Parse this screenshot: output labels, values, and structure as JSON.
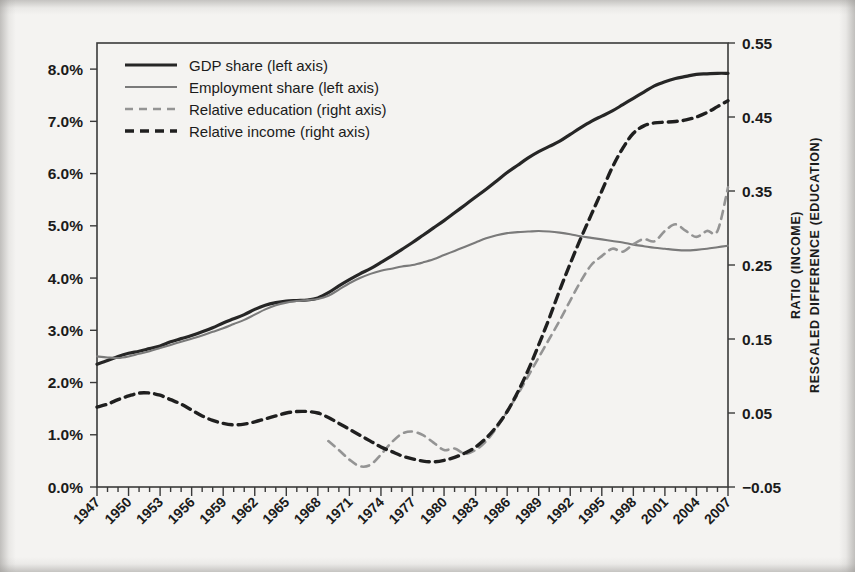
{
  "chart_data": {
    "type": "line",
    "title": "",
    "xlabel": "",
    "ylabel_left": "",
    "ylabel_right_line1": "RATIO (INCOME)",
    "ylabel_right_line2": "RESCALED DIFFERENCE (EDUCATION)",
    "grid": false,
    "legend_position": "top-left",
    "x": [
      1947,
      1948,
      1949,
      1950,
      1951,
      1952,
      1953,
      1954,
      1955,
      1956,
      1957,
      1958,
      1959,
      1960,
      1961,
      1962,
      1963,
      1964,
      1965,
      1966,
      1967,
      1968,
      1969,
      1970,
      1971,
      1972,
      1973,
      1974,
      1975,
      1976,
      1977,
      1978,
      1979,
      1980,
      1981,
      1982,
      1983,
      1984,
      1985,
      1986,
      1987,
      1988,
      1989,
      1990,
      1991,
      1992,
      1993,
      1994,
      1995,
      1996,
      1997,
      1998,
      1999,
      2000,
      2001,
      2002,
      2003,
      2004,
      2005,
      2006,
      2007
    ],
    "xtick_labels": [
      "1947",
      "1950",
      "1953",
      "1956",
      "1959",
      "1962",
      "1965",
      "1968",
      "1971",
      "1974",
      "1977",
      "1980",
      "1983",
      "1986",
      "1989",
      "1992",
      "1995",
      "1998",
      "2001",
      "2004",
      "2007"
    ],
    "xlim": [
      1947,
      2007
    ],
    "left_axis": {
      "ticks": [
        0.0,
        1.0,
        2.0,
        3.0,
        4.0,
        5.0,
        6.0,
        7.0,
        8.0
      ],
      "tick_labels": [
        "0.0%",
        "1.0%",
        "2.0%",
        "3.0%",
        "4.0%",
        "5.0%",
        "6.0%",
        "7.0%",
        "8.0%"
      ],
      "ylim": [
        0.0,
        8.5
      ],
      "unit": "%"
    },
    "right_axis": {
      "ticks": [
        -0.05,
        0.05,
        0.15,
        0.25,
        0.35,
        0.45,
        0.55
      ],
      "tick_labels": [
        "-0.05",
        "0.05",
        "0.15",
        "0.25",
        "0.35",
        "0.45",
        "0.55"
      ],
      "ylim": [
        -0.05,
        0.55
      ]
    },
    "series": [
      {
        "name": "GDP share (left axis)",
        "axis": "left",
        "style": "solid",
        "color": "#262626",
        "width": 3.2,
        "values": [
          2.35,
          2.42,
          2.5,
          2.56,
          2.6,
          2.65,
          2.7,
          2.78,
          2.84,
          2.9,
          2.97,
          3.05,
          3.14,
          3.22,
          3.3,
          3.4,
          3.48,
          3.53,
          3.56,
          3.57,
          3.58,
          3.62,
          3.72,
          3.85,
          3.97,
          4.08,
          4.18,
          4.3,
          4.42,
          4.55,
          4.68,
          4.82,
          4.96,
          5.1,
          5.25,
          5.4,
          5.55,
          5.7,
          5.86,
          6.02,
          6.16,
          6.3,
          6.42,
          6.52,
          6.62,
          6.75,
          6.88,
          7.0,
          7.1,
          7.2,
          7.32,
          7.44,
          7.56,
          7.68,
          7.76,
          7.82,
          7.86,
          7.9,
          7.91,
          7.92,
          7.92
        ]
      },
      {
        "name": "Employment share (left axis)",
        "axis": "left",
        "style": "solid",
        "color": "#7a7a7a",
        "width": 2.1,
        "values": [
          2.5,
          2.48,
          2.47,
          2.5,
          2.55,
          2.6,
          2.66,
          2.72,
          2.78,
          2.84,
          2.9,
          2.97,
          3.04,
          3.12,
          3.2,
          3.3,
          3.4,
          3.48,
          3.53,
          3.56,
          3.58,
          3.6,
          3.66,
          3.78,
          3.9,
          4.0,
          4.08,
          4.14,
          4.18,
          4.22,
          4.25,
          4.3,
          4.36,
          4.44,
          4.52,
          4.6,
          4.68,
          4.76,
          4.82,
          4.86,
          4.88,
          4.89,
          4.9,
          4.89,
          4.87,
          4.84,
          4.8,
          4.77,
          4.74,
          4.71,
          4.68,
          4.64,
          4.61,
          4.58,
          4.56,
          4.54,
          4.53,
          4.54,
          4.56,
          4.59,
          4.62
        ]
      },
      {
        "name": "Relative education (right axis)",
        "axis": "right",
        "style": "dashed",
        "color": "#949494",
        "width": 2.6,
        "start_year": 1969,
        "values": [
          null,
          null,
          null,
          null,
          null,
          null,
          null,
          null,
          null,
          null,
          null,
          null,
          null,
          null,
          null,
          null,
          null,
          null,
          null,
          null,
          null,
          null,
          0.012,
          0.0,
          -0.013,
          -0.022,
          -0.02,
          -0.006,
          0.01,
          0.022,
          0.025,
          0.02,
          0.01,
          0.0,
          0.002,
          -0.005,
          0.0,
          0.012,
          0.03,
          0.052,
          0.075,
          0.1,
          0.125,
          0.15,
          0.175,
          0.202,
          0.228,
          0.25,
          0.262,
          0.272,
          0.268,
          0.278,
          0.285,
          0.282,
          0.296,
          0.305,
          0.296,
          0.288,
          0.296,
          0.296,
          0.355
        ]
      },
      {
        "name": "Relative income (right axis)",
        "axis": "right",
        "style": "dashed",
        "color": "#1f1f1f",
        "width": 3.4,
        "values": [
          0.058,
          0.062,
          0.068,
          0.073,
          0.077,
          0.077,
          0.074,
          0.068,
          0.062,
          0.054,
          0.046,
          0.04,
          0.036,
          0.034,
          0.035,
          0.038,
          0.042,
          0.046,
          0.05,
          0.052,
          0.052,
          0.05,
          0.044,
          0.036,
          0.028,
          0.02,
          0.012,
          0.004,
          -0.002,
          -0.008,
          -0.012,
          -0.015,
          -0.016,
          -0.014,
          -0.01,
          -0.004,
          0.004,
          0.016,
          0.032,
          0.052,
          0.078,
          0.108,
          0.142,
          0.178,
          0.216,
          0.252,
          0.286,
          0.318,
          0.35,
          0.382,
          0.408,
          0.428,
          0.438,
          0.442,
          0.443,
          0.444,
          0.446,
          0.45,
          0.456,
          0.464,
          0.472
        ]
      }
    ]
  },
  "legend": {
    "items": [
      {
        "label": "GDP share (left axis)"
      },
      {
        "label": "Employment share (left axis)"
      },
      {
        "label": "Relative education (right axis)"
      },
      {
        "label": "Relative income (right axis)"
      }
    ]
  }
}
